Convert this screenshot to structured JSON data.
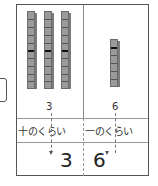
{
  "tens": {
    "rod_count": 3,
    "cubes_per_rod": 10,
    "count_label": "3",
    "place_label": "十のくらい",
    "digit": "3"
  },
  "ones": {
    "cube_count": 6,
    "count_label": "6",
    "place_label": "一のくらい",
    "digit": "6"
  },
  "colors": {
    "cube_fill": "#9a9a9a",
    "cube_border": "#6a6a6a",
    "frame": "#555555"
  }
}
